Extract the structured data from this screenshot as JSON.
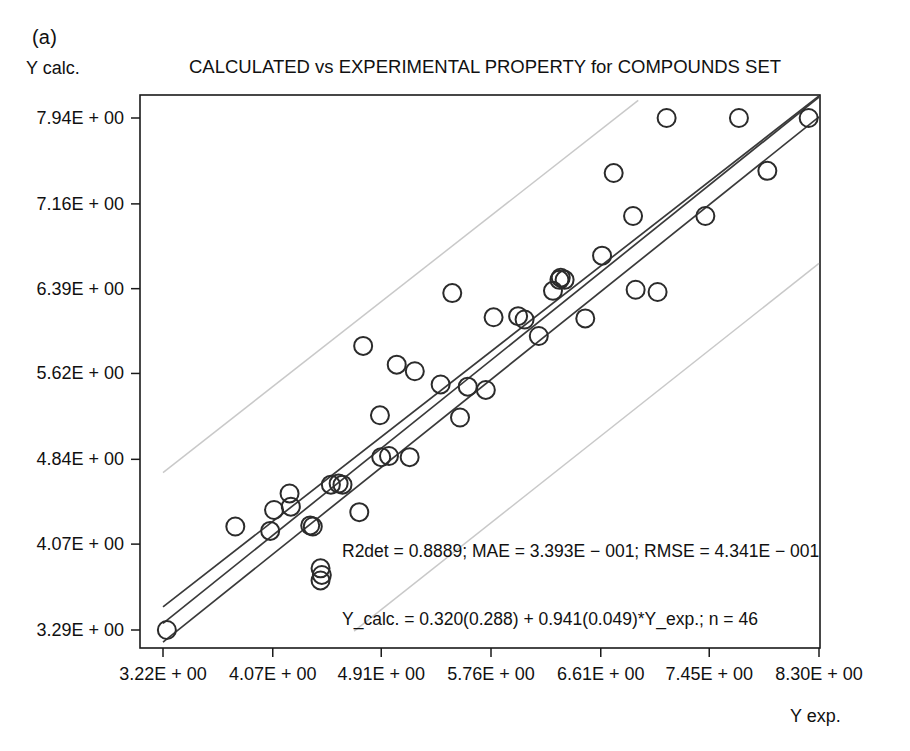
{
  "figure": {
    "panel_label": "(a)",
    "title": "CALCULATED vs EXPERIMENTAL PROPERTY for COMPOUNDS SET",
    "y_axis_label": "Y calc.",
    "x_axis_label": "Y exp.",
    "annotation_line1": "R2det = 0.8889; MAE = 3.393E − 001; RMSE = 4.341E − 001",
    "annotation_line2": "Y_calc. = 0.320(0.288) + 0.941(0.049)*Y_exp.; n = 46"
  },
  "colors": {
    "frame": "#1a1a1a",
    "fit_line": "#3a3a3a",
    "prediction_band": "#c9c9c9",
    "marker_stroke": "#2b2b2b",
    "background": "#ffffff",
    "text": "#111111"
  },
  "statistics": {
    "r2det": "0.8889",
    "mae": "3.393E-001",
    "rmse": "4.341E-001",
    "intercept": "0.320",
    "intercept_se": "0.288",
    "slope": "0.941",
    "slope_se": "0.049",
    "n": "46"
  },
  "chart_data": {
    "type": "scatter",
    "title": "CALCULATED vs EXPERIMENTAL PROPERTY for COMPOUNDS SET",
    "xlabel": "Y exp.",
    "ylabel": "Y calc.",
    "grid": false,
    "legend": false,
    "xlim": [
      3.22,
      8.3
    ],
    "ylim": [
      3.29,
      7.94
    ],
    "xticks": [
      3.22,
      4.07,
      4.91,
      5.76,
      6.61,
      7.45,
      8.3
    ],
    "xticklabels": [
      "3.22E + 00",
      "4.07E + 00",
      "4.91E + 00",
      "5.76E + 00",
      "6.61E + 00",
      "7.45E + 00",
      "8.30E + 00"
    ],
    "yticks": [
      3.29,
      4.07,
      4.84,
      5.62,
      6.39,
      7.16,
      7.94
    ],
    "yticklabels": [
      "3.29E + 00",
      "4.07E + 00",
      "4.84E + 00",
      "5.62E + 00",
      "6.39E + 00",
      "7.16E + 00",
      "7.94E + 00"
    ],
    "marker": "open-circle",
    "series": [
      {
        "name": "compounds",
        "x": [
          3.25,
          3.78,
          4.05,
          4.08,
          4.21,
          4.2,
          4.38,
          4.36,
          4.45,
          4.44,
          4.44,
          4.52,
          4.58,
          4.61,
          4.74,
          4.77,
          4.9,
          4.91,
          4.97,
          5.03,
          5.13,
          5.17,
          5.37,
          5.46,
          5.52,
          5.58,
          5.72,
          5.78,
          5.97,
          6.02,
          6.13,
          6.24,
          6.29,
          6.3,
          6.33,
          6.49,
          6.62,
          6.71,
          6.86,
          6.88,
          7.05,
          7.12,
          7.42,
          7.68,
          7.9,
          8.22
        ],
        "y": [
          3.29,
          4.23,
          4.19,
          4.38,
          4.41,
          4.53,
          4.23,
          4.24,
          3.79,
          3.74,
          3.85,
          4.61,
          4.62,
          4.61,
          4.36,
          5.87,
          5.24,
          4.86,
          4.87,
          5.7,
          4.86,
          5.64,
          5.52,
          6.35,
          5.22,
          5.5,
          5.47,
          6.13,
          6.14,
          6.11,
          5.96,
          6.37,
          6.47,
          6.49,
          6.47,
          6.12,
          6.69,
          7.44,
          7.05,
          6.38,
          6.36,
          7.94,
          7.05,
          7.94,
          7.46,
          7.94
        ]
      }
    ],
    "fit_lines": [
      {
        "name": "regression",
        "x": [
          3.22,
          8.3
        ],
        "y": [
          3.35,
          8.13
        ]
      },
      {
        "name": "confidence-upper",
        "x": [
          3.22,
          8.3
        ],
        "y": [
          3.5,
          8.28
        ]
      },
      {
        "name": "confidence-lower",
        "x": [
          3.22,
          8.3
        ],
        "y": [
          3.18,
          7.95
        ]
      }
    ],
    "prediction_bands": [
      {
        "name": "upper-prediction-band",
        "x": [
          3.22,
          6.9
        ],
        "y": [
          4.72,
          8.1
        ]
      },
      {
        "name": "lower-prediction-band",
        "x": [
          4.7,
          8.3
        ],
        "y": [
          3.28,
          6.62
        ]
      }
    ]
  }
}
